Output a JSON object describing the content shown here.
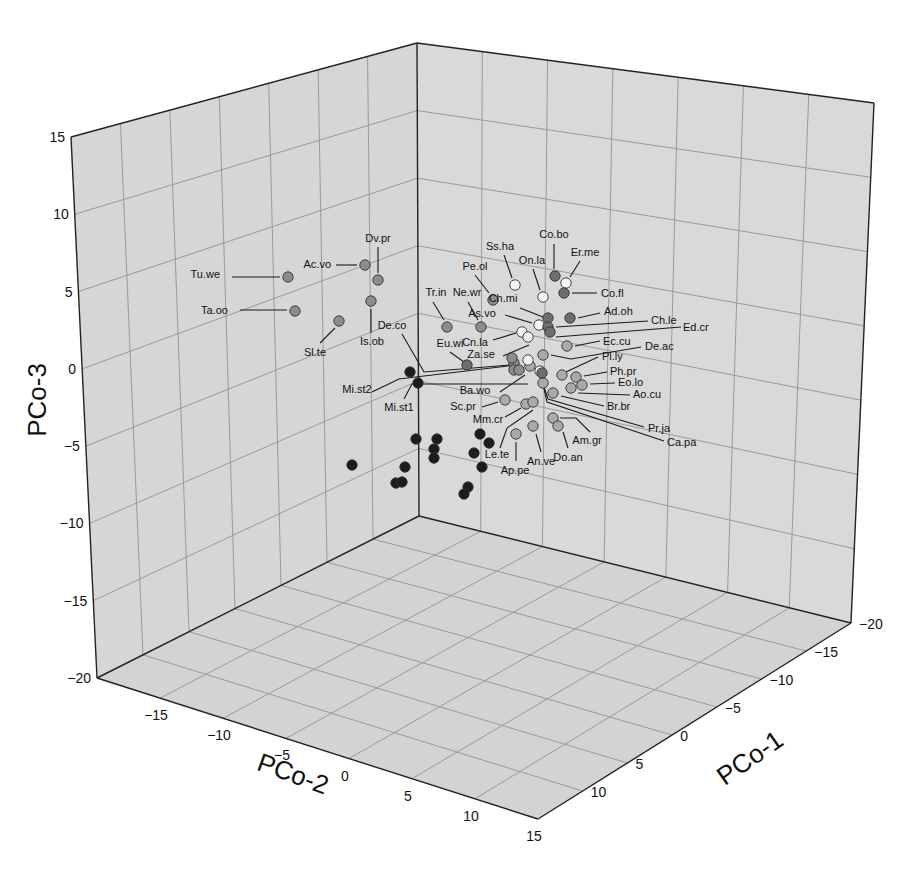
{
  "chart_data": {
    "type": "scatter",
    "subtype": "3d-scatter",
    "title": "",
    "axes": {
      "x": {
        "label": "PCo-1",
        "ticks": [
          -20,
          -15,
          -10,
          -5,
          0,
          5,
          10
        ],
        "range": [
          -20,
          15
        ]
      },
      "y": {
        "label": "PCo-2",
        "ticks": [
          -15,
          -10,
          -5,
          0,
          5,
          10,
          15
        ],
        "range": [
          -20,
          15
        ]
      },
      "z": {
        "label": "PCo-3",
        "ticks": [
          -20,
          -15,
          -10,
          -5,
          0,
          5,
          10,
          15
        ],
        "range": [
          -20,
          15
        ]
      }
    },
    "grid": true,
    "legend": null,
    "tone_colors": {
      "white": "#f4f4f4",
      "light": "#a9a9a9",
      "mid": "#8c8c8c",
      "dark": "#6e6e6e",
      "black": "#1c1c1c"
    },
    "labeled_points": [
      {
        "name": "Tu.we",
        "px": 288,
        "py": 277,
        "tone": "mid",
        "lx": 220,
        "ly": 278,
        "anchor": "end",
        "lead": [
          [
            232,
            277
          ],
          [
            280,
            277
          ]
        ]
      },
      {
        "name": "Ta.oo",
        "px": 295,
        "py": 311,
        "tone": "mid",
        "lx": 228,
        "ly": 314,
        "anchor": "end",
        "lead": [
          [
            240,
            310
          ],
          [
            287,
            310
          ]
        ]
      },
      {
        "name": "Ac.vo",
        "px": 365,
        "py": 265,
        "tone": "mid",
        "lx": 331,
        "ly": 268,
        "anchor": "end",
        "lead": [
          [
            336,
            265
          ],
          [
            357,
            265
          ]
        ]
      },
      {
        "name": "Dv.pr",
        "px": 378,
        "py": 280,
        "tone": "mid",
        "lx": 378,
        "ly": 242,
        "anchor": "middle",
        "lead": [
          [
            378,
            247
          ],
          [
            378,
            273
          ]
        ]
      },
      {
        "name": "Is.ob",
        "px": 371,
        "py": 301,
        "tone": "mid",
        "lx": 372,
        "ly": 345,
        "anchor": "middle",
        "lead": [
          [
            371,
            309
          ],
          [
            371,
            333
          ]
        ]
      },
      {
        "name": "Sl.te",
        "px": 339,
        "py": 321,
        "tone": "mid",
        "lx": 315,
        "ly": 356,
        "anchor": "middle",
        "lead": [
          [
            320,
            343
          ],
          [
            335,
            328
          ]
        ]
      },
      {
        "name": "Tr.in",
        "px": 447,
        "py": 327,
        "tone": "mid",
        "lx": 436,
        "ly": 296,
        "anchor": "middle",
        "lead": [
          [
            433,
            302
          ],
          [
            444,
            320
          ]
        ]
      },
      {
        "name": "Ne.wr",
        "px": 481,
        "py": 327,
        "tone": "mid",
        "lx": 467,
        "ly": 296,
        "anchor": "middle",
        "lead": [
          [
            468,
            302
          ],
          [
            478,
            320
          ]
        ]
      },
      {
        "name": "Pe.ol",
        "px": 493,
        "py": 300,
        "tone": "mid",
        "lx": 475,
        "ly": 270,
        "anchor": "middle",
        "lead": [
          [
            475,
            275
          ],
          [
            489,
            293
          ]
        ]
      },
      {
        "name": "Ss.ha",
        "px": 515,
        "py": 285,
        "tone": "white",
        "lx": 500,
        "ly": 250,
        "anchor": "middle",
        "lead": [
          [
            504,
            255
          ],
          [
            512,
            278
          ]
        ]
      },
      {
        "name": "On.la",
        "px": 543,
        "py": 297,
        "tone": "white",
        "lx": 532,
        "ly": 264,
        "anchor": "middle",
        "lead": [
          [
            533,
            269
          ],
          [
            540,
            290
          ]
        ]
      },
      {
        "name": "Co.bo",
        "px": 555,
        "py": 276,
        "tone": "dark",
        "lx": 554,
        "ly": 238,
        "anchor": "middle",
        "lead": [
          [
            554,
            244
          ],
          [
            554,
            269
          ]
        ]
      },
      {
        "name": "Er.me",
        "px": 566,
        "py": 283,
        "tone": "white",
        "lx": 585,
        "ly": 256,
        "anchor": "middle",
        "lead": [
          [
            580,
            261
          ],
          [
            570,
            277
          ]
        ]
      },
      {
        "name": "Co.fl",
        "px": 564,
        "py": 293,
        "tone": "dark",
        "lx": 601,
        "ly": 297,
        "anchor": "start",
        "lead": [
          [
            572,
            293
          ],
          [
            597,
            293
          ]
        ]
      },
      {
        "name": "Ch.mi",
        "px": 548,
        "py": 318,
        "tone": "dark",
        "lx": 503,
        "ly": 302,
        "anchor": "middle",
        "lead": [
          [
            520,
            308
          ],
          [
            543,
            317
          ]
        ]
      },
      {
        "name": "As.vo",
        "px": 539,
        "py": 325,
        "tone": "white",
        "lx": 482,
        "ly": 317,
        "anchor": "middle",
        "lead": [
          [
            505,
            315
          ],
          [
            532,
            323
          ]
        ]
      },
      {
        "name": "Ad.oh",
        "px": 570,
        "py": 318,
        "tone": "dark",
        "lx": 604,
        "ly": 315,
        "anchor": "start",
        "lead": [
          [
            578,
            318
          ],
          [
            600,
            313
          ]
        ]
      },
      {
        "name": "Ch.le",
        "px": 548,
        "py": 327,
        "tone": "dark",
        "lx": 651,
        "ly": 324,
        "anchor": "start",
        "lead": [
          [
            556,
            327
          ],
          [
            648,
            321
          ]
        ]
      },
      {
        "name": "Ed.cr",
        "px": 550,
        "py": 332,
        "tone": "dark",
        "lx": 683,
        "ly": 331,
        "anchor": "start",
        "lead": [
          [
            556,
            337
          ],
          [
            681,
            327
          ]
        ]
      },
      {
        "name": "Cn.la",
        "px": 522,
        "py": 332,
        "tone": "white",
        "lx": 475,
        "ly": 346,
        "anchor": "middle",
        "lead": [
          [
            493,
            340
          ],
          [
            516,
            333
          ]
        ]
      },
      {
        "name": "Ec.cu",
        "px": 567,
        "py": 346,
        "tone": "light",
        "lx": 603,
        "ly": 345,
        "anchor": "start",
        "lead": [
          [
            575,
            346
          ],
          [
            600,
            341
          ]
        ]
      },
      {
        "name": "De.ac",
        "px": 543,
        "py": 355,
        "tone": "light",
        "lx": 645,
        "ly": 350,
        "anchor": "start",
        "lead": [
          [
            551,
            355
          ],
          [
            571,
            359
          ],
          [
            641,
            347
          ]
        ]
      },
      {
        "name": "Za.se",
        "px": 528,
        "py": 337,
        "tone": "white",
        "lx": 481,
        "ly": 358,
        "anchor": "middle",
        "lead": [
          [
            503,
            356
          ],
          [
            529,
            345
          ]
        ]
      },
      {
        "name": "De.co",
        "px": 512,
        "py": 358,
        "tone": "mid",
        "lx": 392,
        "ly": 329,
        "anchor": "middle",
        "lead": [
          [
            402,
            334
          ],
          [
            424,
            372
          ],
          [
            510,
            365
          ]
        ]
      },
      {
        "name": "Eu.wi",
        "px": 467,
        "py": 365,
        "tone": "dark",
        "lx": 450,
        "ly": 347,
        "anchor": "middle",
        "lead": [
          [
            450,
            352
          ],
          [
            464,
            362
          ]
        ]
      },
      {
        "name": "Pl.ly",
        "px": 562,
        "py": 375,
        "tone": "light",
        "lx": 602,
        "ly": 360,
        "anchor": "start",
        "lead": [
          [
            566,
            372
          ],
          [
            598,
            357
          ]
        ]
      },
      {
        "name": "Ph.pr",
        "px": 576,
        "py": 377,
        "tone": "light",
        "lx": 610,
        "ly": 375,
        "anchor": "start",
        "lead": [
          [
            584,
            376
          ],
          [
            607,
            372
          ]
        ]
      },
      {
        "name": "Eo.lo",
        "px": 582,
        "py": 385,
        "tone": "light",
        "lx": 618,
        "ly": 386,
        "anchor": "start",
        "lead": [
          [
            590,
            384
          ],
          [
            615,
            383
          ]
        ]
      },
      {
        "name": "Ao.cu",
        "px": 571,
        "py": 388,
        "tone": "light",
        "lx": 633,
        "ly": 398,
        "anchor": "start",
        "lead": [
          [
            578,
            393
          ],
          [
            630,
            395
          ]
        ]
      },
      {
        "name": "Br.br",
        "px": 553,
        "py": 393,
        "tone": "light",
        "lx": 607,
        "ly": 410,
        "anchor": "start",
        "lead": [
          [
            561,
            396
          ],
          [
            604,
            406
          ]
        ]
      },
      {
        "name": "Mi.st2",
        "px": 410,
        "py": 372,
        "tone": "black",
        "lx": 357,
        "ly": 393,
        "anchor": "middle",
        "lead": [
          [
            372,
            392
          ],
          [
            399,
            379
          ],
          [
            516,
            365
          ]
        ]
      },
      {
        "name": "Mi.st1",
        "px": 418,
        "py": 383,
        "tone": "black",
        "lx": 399,
        "ly": 411,
        "anchor": "middle",
        "lead": [
          [
            404,
            399
          ],
          [
            412,
            384
          ],
          [
            528,
            384
          ]
        ]
      },
      {
        "name": "Ba.wo",
        "px": 519,
        "py": 370,
        "tone": "mid",
        "lx": 475,
        "ly": 394,
        "anchor": "middle",
        "lead": [
          [
            500,
            392
          ],
          [
            525,
            375
          ]
        ]
      },
      {
        "name": "Sc.pr",
        "px": 505,
        "py": 400,
        "tone": "light",
        "lx": 463,
        "ly": 410,
        "anchor": "middle",
        "lead": [
          [
            482,
            407
          ],
          [
            498,
            402
          ]
        ]
      },
      {
        "name": "Mm.cr",
        "px": 526,
        "py": 404,
        "tone": "light",
        "lx": 488,
        "ly": 423,
        "anchor": "middle",
        "lead": [
          [
            505,
            417
          ],
          [
            521,
            408
          ]
        ]
      },
      {
        "name": "Le.te",
        "px": 533,
        "py": 402,
        "tone": "light",
        "lx": 497,
        "ly": 458,
        "anchor": "middle",
        "lead": [
          [
            500,
            448
          ],
          [
            507,
            428
          ],
          [
            533,
            410
          ]
        ]
      },
      {
        "name": "Ap.pe",
        "px": 516,
        "py": 434,
        "tone": "light",
        "lx": 515,
        "ly": 474,
        "anchor": "middle",
        "lead": [
          [
            516,
            442
          ],
          [
            516,
            461
          ]
        ]
      },
      {
        "name": "An.ve",
        "px": 533,
        "py": 426,
        "tone": "light",
        "lx": 541,
        "ly": 465,
        "anchor": "middle",
        "lead": [
          [
            536,
            434
          ],
          [
            541,
            452
          ]
        ]
      },
      {
        "name": "Am.gr",
        "px": 553,
        "py": 418,
        "tone": "light",
        "lx": 587,
        "ly": 444,
        "anchor": "middle",
        "lead": [
          [
            560,
            418
          ],
          [
            576,
            418
          ],
          [
            590,
            432
          ]
        ]
      },
      {
        "name": "Do.an",
        "px": 558,
        "py": 426,
        "tone": "light",
        "lx": 568,
        "ly": 461,
        "anchor": "middle",
        "lead": [
          [
            563,
            432
          ],
          [
            568,
            448
          ]
        ]
      },
      {
        "name": "Pr.ja",
        "px": 540,
        "py": 371,
        "tone": "white",
        "lx": 648,
        "ly": 432,
        "anchor": "start",
        "lead": [
          [
            541,
            378
          ],
          [
            548,
            399
          ],
          [
            644,
            427
          ]
        ]
      },
      {
        "name": "Ca.pa",
        "px": 542,
        "py": 373,
        "tone": "dark",
        "lx": 667,
        "ly": 446,
        "anchor": "start",
        "lead": [
          [
            542,
            380
          ],
          [
            547,
            402
          ],
          [
            664,
            441
          ]
        ]
      }
    ],
    "unlabeled_points": [
      {
        "px": 530,
        "py": 366,
        "tone": "light"
      },
      {
        "px": 528,
        "py": 360,
        "tone": "white"
      },
      {
        "px": 514,
        "py": 363,
        "tone": "mid"
      },
      {
        "px": 514,
        "py": 370,
        "tone": "mid"
      },
      {
        "px": 543,
        "py": 383,
        "tone": "light"
      },
      {
        "px": 437,
        "py": 439,
        "tone": "black"
      },
      {
        "px": 434,
        "py": 449,
        "tone": "black"
      },
      {
        "px": 352,
        "py": 465,
        "tone": "black"
      },
      {
        "px": 396,
        "py": 483,
        "tone": "black"
      },
      {
        "px": 402,
        "py": 482,
        "tone": "black"
      },
      {
        "px": 405,
        "py": 467,
        "tone": "black"
      },
      {
        "px": 416,
        "py": 439,
        "tone": "black"
      },
      {
        "px": 434,
        "py": 458,
        "tone": "black"
      },
      {
        "px": 480,
        "py": 434,
        "tone": "black"
      },
      {
        "px": 489,
        "py": 443,
        "tone": "black"
      },
      {
        "px": 474,
        "py": 453,
        "tone": "black"
      },
      {
        "px": 482,
        "py": 467,
        "tone": "black"
      },
      {
        "px": 468,
        "py": 487,
        "tone": "black"
      },
      {
        "px": 464,
        "py": 494,
        "tone": "black"
      }
    ]
  },
  "geometry": {
    "back_top": [
      417,
      43
    ],
    "back_bottom": [
      419,
      516
    ],
    "left_top": [
      71,
      137
    ],
    "left_bottom": [
      97,
      678
    ],
    "right_top": [
      874,
      103
    ],
    "right_bottom": [
      851,
      623
    ],
    "front_bottom": [
      538,
      819
    ]
  }
}
